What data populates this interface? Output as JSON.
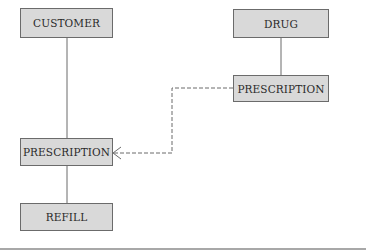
{
  "diagram": {
    "type": "entity-relationship",
    "entities": [
      {
        "id": "customer",
        "label": "CUSTOMER"
      },
      {
        "id": "drug",
        "label": "DRUG"
      },
      {
        "id": "prescription_right",
        "label": "PRESCRIPTION"
      },
      {
        "id": "prescription_left",
        "label": "PRESCRIPTION"
      },
      {
        "id": "refill",
        "label": "REFILL"
      }
    ],
    "relationships": [
      {
        "from": "customer",
        "to": "prescription_left",
        "style": "solid"
      },
      {
        "from": "drug",
        "to": "prescription_right",
        "style": "solid"
      },
      {
        "from": "prescription_left",
        "to": "refill",
        "style": "solid"
      },
      {
        "from": "prescription_right",
        "to": "prescription_left",
        "style": "dashed",
        "end": "crows-foot"
      }
    ],
    "colors": {
      "box_fill": "#d9d9d9",
      "box_border": "#6b6b6b",
      "line": "#6b6b6b",
      "text": "#2a2a2a"
    }
  }
}
